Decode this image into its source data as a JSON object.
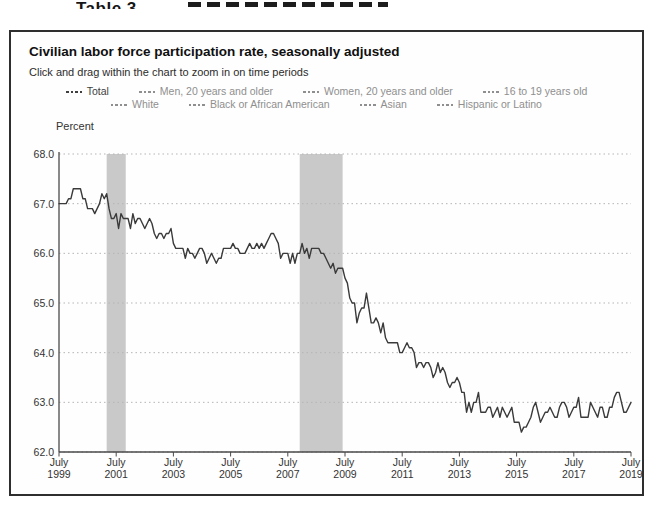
{
  "page": {
    "cropped_caption": "Table 3"
  },
  "panel": {
    "title": "Civilian labor force participation rate, seasonally adjusted",
    "subtitle": "Click and drag within the chart to zoom in on time periods"
  },
  "legend": {
    "rows": [
      [
        {
          "label": "Total",
          "active": true
        },
        {
          "label": "Men, 20 years and older",
          "active": false
        },
        {
          "label": "Women, 20 years and older",
          "active": false
        },
        {
          "label": "16 to 19 years old",
          "active": false
        }
      ],
      [
        {
          "label": "White",
          "active": false
        },
        {
          "label": "Black or African American",
          "active": false
        },
        {
          "label": "Asian",
          "active": false
        },
        {
          "label": "Hispanic or Latino",
          "active": false
        }
      ]
    ]
  },
  "chart_data": {
    "type": "line",
    "title": "Civilian labor force participation rate, seasonally adjusted",
    "ylabel": "Percent",
    "ylim": [
      62.0,
      68.0
    ],
    "grid": "horizontal-dotted",
    "x_start": "July 1999",
    "x_end": "July 2019",
    "x_frequency": "monthly",
    "y_ticks": [
      "68.0",
      "67.0",
      "66.0",
      "65.0",
      "64.0",
      "63.0",
      "62.0"
    ],
    "x_ticks": [
      {
        "line1": "July",
        "line2": "1999",
        "month_index": 0
      },
      {
        "line1": "July",
        "line2": "2001",
        "month_index": 24
      },
      {
        "line1": "July",
        "line2": "2003",
        "month_index": 48
      },
      {
        "line1": "July",
        "line2": "2005",
        "month_index": 72
      },
      {
        "line1": "July",
        "line2": "2007",
        "month_index": 96
      },
      {
        "line1": "July",
        "line2": "2009",
        "month_index": 120
      },
      {
        "line1": "July",
        "line2": "2011",
        "month_index": 144
      },
      {
        "line1": "July",
        "line2": "2013",
        "month_index": 168
      },
      {
        "line1": "July",
        "line2": "2015",
        "month_index": 192
      },
      {
        "line1": "July",
        "line2": "2017",
        "month_index": 216
      },
      {
        "line1": "July",
        "line2": "2019",
        "month_index": 240
      }
    ],
    "recession_bands": [
      {
        "label": "2001 recession",
        "from_index": 20,
        "to_index": 28
      },
      {
        "label": "2007-2009 recession",
        "from_index": 101,
        "to_index": 119
      }
    ],
    "series": [
      {
        "name": "Total",
        "color": "#3a3a3a",
        "values": [
          67.0,
          67.0,
          67.0,
          67.0,
          67.1,
          67.1,
          67.3,
          67.3,
          67.3,
          67.3,
          67.1,
          67.1,
          66.9,
          66.9,
          66.9,
          66.8,
          66.9,
          67.0,
          67.2,
          67.1,
          67.2,
          66.9,
          66.7,
          66.7,
          66.8,
          66.5,
          66.8,
          66.7,
          66.7,
          66.7,
          66.5,
          66.8,
          66.6,
          66.7,
          66.7,
          66.6,
          66.5,
          66.6,
          66.7,
          66.6,
          66.4,
          66.3,
          66.4,
          66.4,
          66.3,
          66.4,
          66.4,
          66.5,
          66.2,
          66.1,
          66.1,
          66.1,
          66.1,
          65.9,
          66.1,
          66.0,
          66.0,
          65.9,
          66.0,
          66.1,
          66.1,
          66.0,
          65.8,
          65.9,
          66.0,
          65.9,
          65.8,
          65.9,
          65.9,
          66.1,
          66.1,
          66.1,
          66.1,
          66.2,
          66.1,
          66.1,
          66.0,
          66.0,
          66.0,
          66.1,
          66.2,
          66.1,
          66.1,
          66.2,
          66.1,
          66.2,
          66.1,
          66.2,
          66.3,
          66.4,
          66.4,
          66.3,
          66.2,
          65.9,
          66.0,
          66.0,
          66.0,
          65.8,
          66.0,
          65.8,
          66.0,
          66.0,
          66.2,
          66.0,
          66.1,
          65.9,
          66.1,
          66.1,
          66.1,
          66.1,
          66.0,
          66.0,
          65.9,
          65.8,
          65.7,
          65.8,
          65.6,
          65.7,
          65.7,
          65.7,
          65.5,
          65.4,
          65.1,
          65.0,
          65.0,
          64.6,
          64.8,
          64.9,
          64.9,
          65.2,
          64.9,
          64.6,
          64.6,
          64.7,
          64.6,
          64.4,
          64.6,
          64.3,
          64.2,
          64.2,
          64.2,
          64.2,
          64.2,
          64.0,
          64.0,
          64.1,
          64.2,
          64.1,
          64.1,
          64.0,
          63.7,
          63.8,
          63.8,
          63.7,
          63.8,
          63.8,
          63.7,
          63.5,
          63.6,
          63.8,
          63.6,
          63.7,
          63.6,
          63.4,
          63.3,
          63.4,
          63.4,
          63.5,
          63.4,
          63.2,
          63.2,
          62.8,
          63.0,
          62.8,
          63.0,
          63.0,
          63.2,
          62.8,
          62.8,
          62.8,
          62.9,
          62.9,
          62.7,
          62.8,
          62.9,
          62.7,
          62.9,
          62.8,
          62.7,
          62.8,
          62.9,
          62.6,
          62.6,
          62.6,
          62.4,
          62.5,
          62.5,
          62.6,
          62.7,
          62.9,
          63.0,
          62.8,
          62.6,
          62.7,
          62.8,
          62.8,
          62.9,
          62.8,
          62.7,
          62.7,
          62.9,
          63.0,
          63.0,
          62.9,
          62.7,
          62.8,
          62.9,
          62.9,
          63.1,
          62.7,
          62.7,
          62.7,
          62.7,
          63.0,
          62.9,
          62.8,
          62.7,
          62.9,
          62.9,
          62.7,
          62.7,
          62.9,
          62.9,
          63.1,
          63.2,
          63.2,
          63.0,
          62.8,
          62.8,
          62.9,
          63.0
        ]
      }
    ]
  },
  "colors": {
    "line": "#3a3a3a",
    "axis": "#4a4a4a",
    "grid": "#b5b5b5",
    "recession_band": "#c9c9c9",
    "legend_inactive": "#8f8f8f",
    "legend_active": "#3f3f3f",
    "panel_border": "#2e2e2e"
  }
}
